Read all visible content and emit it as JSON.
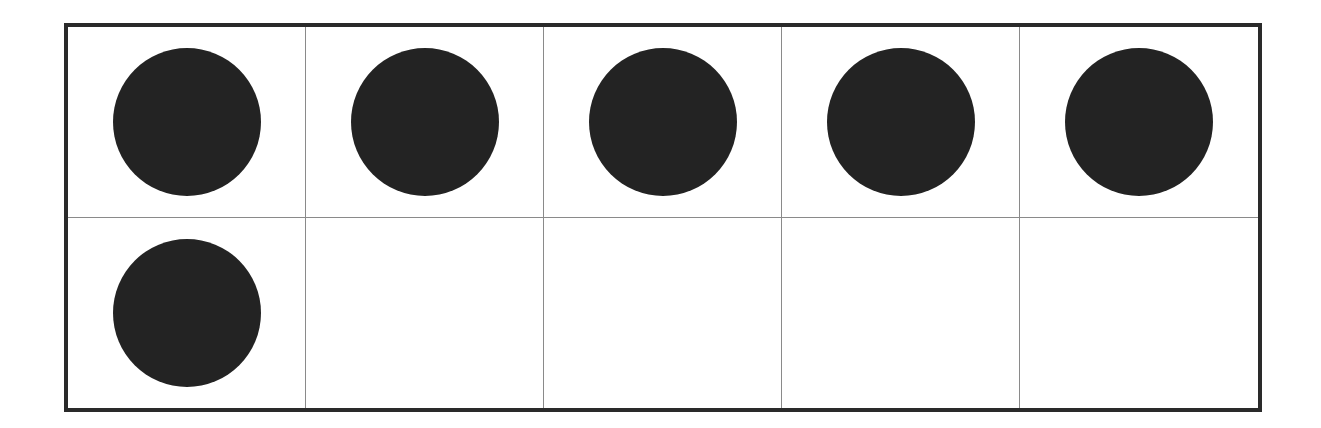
{
  "ten_frame": {
    "rows": 2,
    "columns": 5,
    "filled_count": 6,
    "counter_color": "#232323",
    "border_color": "#2a2a2a",
    "grid_line_color": "#8a8a8a",
    "cells": [
      {
        "filled": true
      },
      {
        "filled": true
      },
      {
        "filled": true
      },
      {
        "filled": true
      },
      {
        "filled": true
      },
      {
        "filled": true
      },
      {
        "filled": false
      },
      {
        "filled": false
      },
      {
        "filled": false
      },
      {
        "filled": false
      }
    ]
  }
}
